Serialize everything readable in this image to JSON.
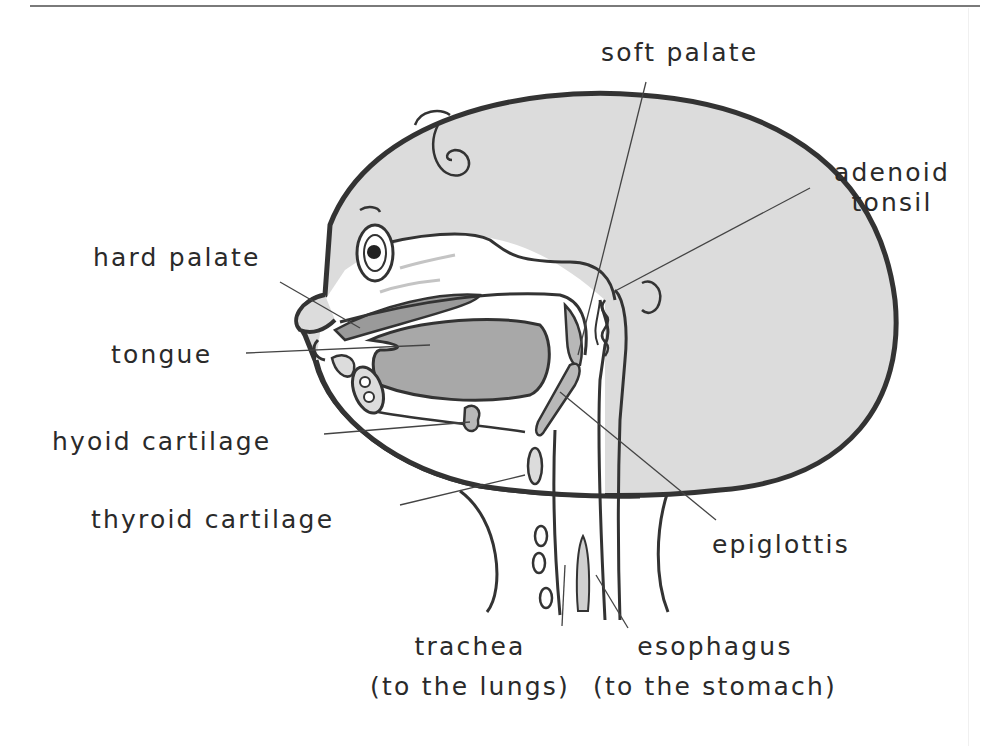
{
  "figure": {
    "colors": {
      "outline": "#333333",
      "skin_fill": "#dcdcdc",
      "tissue_dark": "#9a9a9a",
      "tissue_mid": "#b8b8b8",
      "inner_white": "#ffffff"
    }
  },
  "labels": {
    "soft_palate": "soft palate",
    "adenoid_tonsil_1": "adenoid",
    "adenoid_tonsil_2": "tonsil",
    "hard_palate": "hard palate",
    "tongue": "tongue",
    "hyoid_cartilage": "hyoid cartilage",
    "thyroid_cartilage": "thyroid cartilage",
    "epiglottis": "epiglottis",
    "trachea": "trachea",
    "trachea_note": "(to the lungs)",
    "esophagus": "esophagus",
    "esophagus_note": "(to the stomach)"
  }
}
